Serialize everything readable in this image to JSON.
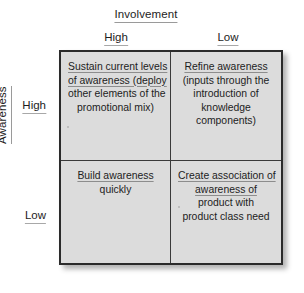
{
  "diagram": {
    "x_axis": {
      "title": "Involvement",
      "labels": [
        "High",
        "Low"
      ]
    },
    "y_axis": {
      "title": "Awareness",
      "labels": [
        "High",
        "Low"
      ]
    },
    "quadrants": [
      {
        "id": "high-awareness-high-involvement",
        "lines": [
          {
            "text": "Sustain current levels",
            "underline": true
          },
          {
            "text": "of awareness (deploy",
            "underline": true
          },
          {
            "text": "other elements of the",
            "underline": false
          },
          {
            "text": "promotional mix)",
            "underline": false
          }
        ]
      },
      {
        "id": "high-awareness-low-involvement",
        "lines": [
          {
            "text": "Refine awareness",
            "underline": true
          },
          {
            "text": "(inputs through the",
            "underline": false
          },
          {
            "text": "introduction of",
            "underline": false
          },
          {
            "text": "knowledge",
            "underline": false
          },
          {
            "text": "components)",
            "underline": false
          }
        ]
      },
      {
        "id": "low-awareness-high-involvement",
        "lines": [
          {
            "text": "Build awareness",
            "underline": true
          },
          {
            "text": "quickly",
            "underline": false
          }
        ]
      },
      {
        "id": "low-awareness-low-involvement",
        "lines": [
          {
            "text": "Create association of",
            "underline": true
          },
          {
            "text": "awareness of",
            "underline": true
          },
          {
            "text": "product with",
            "underline": false
          },
          {
            "text": "product class need",
            "underline": false
          }
        ]
      }
    ]
  }
}
